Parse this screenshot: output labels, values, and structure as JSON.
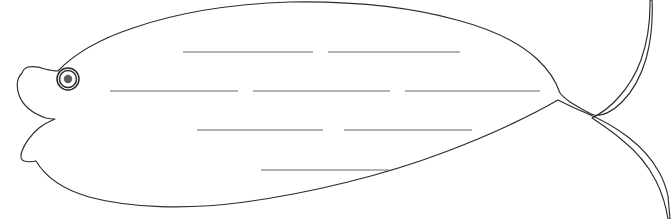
{
  "worksheet": {
    "title": "Fish outline writing worksheet",
    "background_color": "#ffffff",
    "width": 671,
    "height": 219
  },
  "colors": {
    "outline": "#2b2b30",
    "writing_line": "#6a6a6e",
    "pupil": "#5e5e62",
    "body_fill": "#ffffff"
  },
  "fish": {
    "name": "fish-outline",
    "body_fill": "#ffffff",
    "outline_color": "#2b2b30",
    "outline_width": 1.15,
    "eye": {
      "name": "fish-eye",
      "center_x": 68,
      "center_y": 79,
      "outer_radius": 11,
      "inner_radius": 8.5,
      "pupil_radius": 4.2,
      "pupil_color": "#5e5e62"
    },
    "path": "M 22 73 C 17 78 16 86 19 95 C 23 106 34 114 46 118 C 50 119 52 119 55 119 C 50 121 44 124 39 128 C 31 135 25 143 22 151 C 20 157 21 160 24 161 C 27 162 31 162 36 161 C 46 178 65 190 89 197 C 130 208 186 210 245 202 C 310 193 385 175 445 152 C 490 135 530 116 558 100 C 566 104 576 109 586 113 C 600 119 615 127 628 137 C 641 147 652 159 659 172 C 663 179 666 187 668 196 L 670 219 L 668 219 C 666 206 662 193 656 181 C 648 165 636 151 622 140 C 612 131 601 124 592 118 C 602 113 611 106 618 98 C 628 87 636 74 641 60 C 647 43 650 24 650 5 L 650 0 L 652 0 C 653 20 651 41 646 59 C 641 76 633 91 622 102 C 613 111 602 117 594 115 C 588 113 578 107 570 102 C 566 99 562 96 560 93 C 556 81 548 69 536 58 C 518 42 491 29 457 20 C 410 7 350 1 290 2 C 232 4 176 13 133 28 C 100 39 74 54 58 71 C 54 71 49 70 45 69 C 39 67 33 66 28 67 C 25 68 23 70 22 73 Z",
    "tail_note": "forked caudal fin on right",
    "head_note": "pointed snout with open mouth notch on left"
  },
  "writing_lines": {
    "name": "writing-lines",
    "count": 8,
    "rows": [
      {
        "row": 1,
        "y": 52,
        "segments": [
          {
            "x1": 183,
            "x2": 313
          },
          {
            "x1": 328,
            "x2": 460
          }
        ]
      },
      {
        "row": 2,
        "y": 91,
        "segments": [
          {
            "x1": 110,
            "x2": 238
          },
          {
            "x1": 253,
            "x2": 390
          },
          {
            "x1": 405,
            "x2": 540
          }
        ]
      },
      {
        "row": 3,
        "y": 130,
        "segments": [
          {
            "x1": 197,
            "x2": 323
          },
          {
            "x1": 344,
            "x2": 472
          }
        ]
      },
      {
        "row": 4,
        "y": 170,
        "segments": [
          {
            "x1": 261,
            "x2": 389
          }
        ]
      }
    ]
  }
}
